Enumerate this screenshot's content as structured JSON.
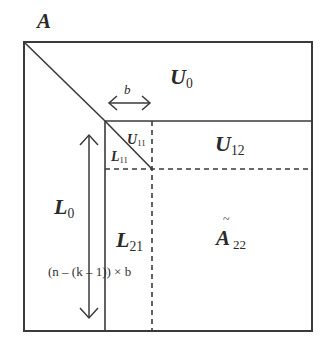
{
  "figure": {
    "matrix_label": "A",
    "blocks": {
      "U0": {
        "symbol": "U",
        "sub": "0"
      },
      "U12": {
        "symbol": "U",
        "sub": "12"
      },
      "U11": {
        "symbol": "U",
        "sub": "11"
      },
      "L11": {
        "symbol": "L",
        "sub": "11"
      },
      "L0": {
        "symbol": "L",
        "sub": "0"
      },
      "L21": {
        "symbol": "L",
        "sub": "21"
      },
      "A22": {
        "symbol": "A",
        "accent": "~",
        "sub": "22"
      }
    },
    "block_width_label": "b",
    "height_label": "(n – (k – 1)) × b"
  },
  "colors": {
    "line": "#3a3a3a",
    "text": "#2a2a2a",
    "background": "#ffffff"
  }
}
